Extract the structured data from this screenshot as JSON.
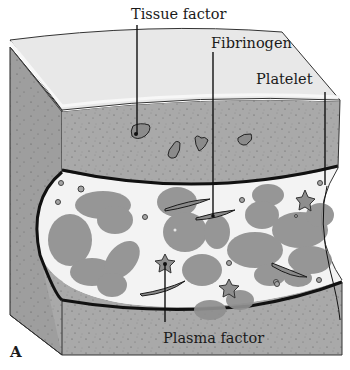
{
  "figure": {
    "panel_label": "A",
    "colors": {
      "tissue": "#a9a9a9",
      "tissue_dark": "#9c9c9c",
      "top_surface": "#e9e9e9",
      "lumen": "#f3f3f3",
      "cell": "#8e8e8e",
      "platelet": "#8a8a8a",
      "outline": "#1b1b1b"
    },
    "labels": {
      "tissue_factor": "Tissue factor",
      "fibrinogen": "Fibrinogen",
      "platelet": "Platelet",
      "plasma_factor": "Plasma factor"
    }
  }
}
